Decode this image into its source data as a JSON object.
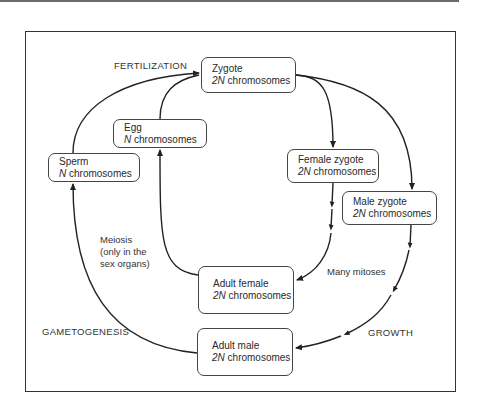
{
  "diagram": {
    "nodes": {
      "zygote": {
        "title": "Zygote",
        "ploidy": "2N",
        "suffix": " chromosomes"
      },
      "egg": {
        "title": "Egg",
        "ploidy": "N",
        "suffix": " chromosomes"
      },
      "sperm": {
        "title": "Sperm",
        "ploidy": "N",
        "suffix": " chromosomes"
      },
      "female_zygote": {
        "title": "Female zygote",
        "ploidy": "2N",
        "suffix": " chromosomes"
      },
      "male_zygote": {
        "title": "Male zygote",
        "ploidy": "2N",
        "suffix": " chromosomes"
      },
      "adult_female": {
        "title": "Adult female",
        "ploidy": "2N",
        "suffix": " chromosomes"
      },
      "adult_male": {
        "title": "Adult male",
        "ploidy": "2N",
        "suffix": " chromosomes"
      }
    },
    "labels": {
      "fertilization": "FERTILIZATION",
      "meiosis_line1": "Meiosis",
      "meiosis_line2": "(only in the",
      "meiosis_line3": "sex organs)",
      "many_mitoses": "Many mitoses",
      "gametogenesis": "GAMETOGENESIS",
      "growth": "GROWTH"
    },
    "edges": [
      {
        "from": "sperm",
        "to": "zygote",
        "label": "FERTILIZATION"
      },
      {
        "from": "egg",
        "to": "zygote",
        "label": "FERTILIZATION"
      },
      {
        "from": "zygote",
        "to": "female_zygote"
      },
      {
        "from": "zygote",
        "to": "male_zygote"
      },
      {
        "from": "female_zygote",
        "to": "adult_female",
        "label": "Many mitoses"
      },
      {
        "from": "male_zygote",
        "to": "adult_male",
        "label": "GROWTH"
      },
      {
        "from": "adult_female",
        "to": "egg",
        "label": "Meiosis (only in the sex organs)"
      },
      {
        "from": "adult_male",
        "to": "sperm",
        "label": "GAMETOGENESIS"
      }
    ],
    "colors": {
      "line": "#222222",
      "frame": "#333333",
      "text": "#2a2a2a"
    }
  }
}
